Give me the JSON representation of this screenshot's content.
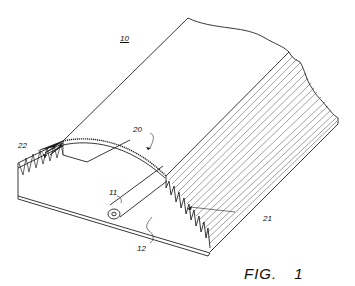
{
  "figure": {
    "caption": "FIG.",
    "number": "1",
    "labels": {
      "assembly": "10",
      "tube": "11",
      "base_sheet": "12",
      "arched_region": "20",
      "pleated_region": "21",
      "pleat_edge": "22"
    },
    "colors": {
      "line": "#222222",
      "background": "#ffffff"
    }
  }
}
